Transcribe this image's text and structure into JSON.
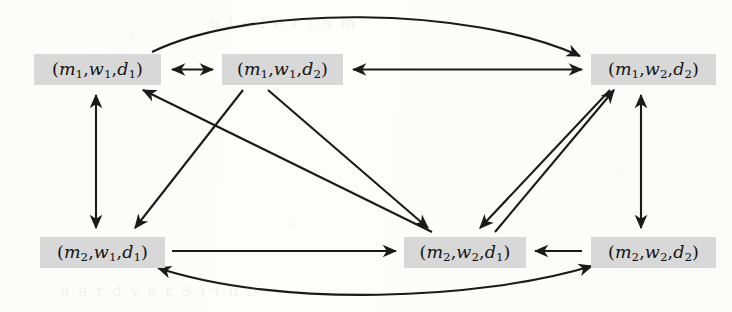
{
  "diagram": {
    "type": "directed-graph",
    "title": "",
    "background_color": "#fdfdfc",
    "node_fill_color": "#d8d8d8",
    "edge_color": "#1a1a1a",
    "nodes": [
      {
        "id": "m1w1d1",
        "label": "(m1,w1,d1)",
        "m": "1",
        "w": "1",
        "d": "1",
        "x": 34,
        "y": 54,
        "width": 127,
        "height": 31,
        "row": "top",
        "col": "left"
      },
      {
        "id": "m1w1d2",
        "label": "(m1,w1,d2)",
        "m": "1",
        "w": "1",
        "d": "2",
        "x": 222,
        "y": 54,
        "width": 121,
        "height": 31,
        "row": "top",
        "col": "middle"
      },
      {
        "id": "m1w2d2",
        "label": "(m1,w2,d2)",
        "m": "1",
        "w": "2",
        "d": "2",
        "x": 591,
        "y": 54,
        "width": 125,
        "height": 31,
        "row": "top",
        "col": "right"
      },
      {
        "id": "m2w1d1",
        "label": "(m2,w1,d1)",
        "m": "2",
        "w": "1",
        "d": "1",
        "x": 40,
        "y": 237,
        "width": 125,
        "height": 31,
        "row": "bottom",
        "col": "left"
      },
      {
        "id": "m2w2d1",
        "label": "(m2,w2,d1)",
        "m": "2",
        "w": "2",
        "d": "1",
        "x": 404,
        "y": 237,
        "width": 122,
        "height": 31,
        "row": "bottom",
        "col": "middle"
      },
      {
        "id": "m2w2d2",
        "label": "(m2,w2,d2)",
        "m": "2",
        "w": "2",
        "d": "2",
        "x": 591,
        "y": 237,
        "width": 125,
        "height": 31,
        "row": "bottom",
        "col": "right"
      }
    ],
    "edges": [
      {
        "from": "m1w1d1",
        "to": "m1w1d2",
        "direction": "both",
        "shape": "straight",
        "name": "edge-m1w1d1-m1w1d2"
      },
      {
        "from": "m1w1d2",
        "to": "m1w2d2",
        "direction": "both",
        "shape": "straight",
        "name": "edge-m1w1d2-m1w2d2"
      },
      {
        "from": "m1w1d1",
        "to": "m1w2d2",
        "direction": "forward",
        "shape": "curve-up",
        "name": "edge-m1w1d1-m1w2d2-arc"
      },
      {
        "from": "m1w1d1",
        "to": "m2w1d1",
        "direction": "both",
        "shape": "straight",
        "name": "edge-m1w1d1-m2w1d1"
      },
      {
        "from": "m1w2d2",
        "to": "m2w2d2",
        "direction": "both",
        "shape": "straight",
        "name": "edge-m1w2d2-m2w2d2"
      },
      {
        "from": "m1w1d2",
        "to": "m2w1d1",
        "direction": "forward",
        "shape": "straight",
        "name": "edge-m1w1d2-m2w1d1"
      },
      {
        "from": "m1w1d2",
        "to": "m2w2d1",
        "direction": "forward",
        "shape": "straight",
        "name": "edge-m1w1d2-m2w2d1"
      },
      {
        "from": "m1w2d2",
        "to": "m2w2d1",
        "direction": "forward",
        "shape": "straight",
        "name": "edge-m1w2d2-m2w2d1"
      },
      {
        "from": "m2w2d1",
        "to": "m1w1d1",
        "direction": "forward",
        "shape": "straight",
        "name": "edge-m2w2d1-m1w1d1"
      },
      {
        "from": "m2w2d1",
        "to": "m1w2d2",
        "direction": "forward",
        "shape": "straight",
        "name": "edge-m2w2d1-m1w2d2"
      },
      {
        "from": "m2w1d1",
        "to": "m2w2d1",
        "direction": "forward",
        "shape": "straight",
        "name": "edge-m2w1d1-m2w2d1"
      },
      {
        "from": "m2w2d2",
        "to": "m2w2d1",
        "direction": "forward",
        "shape": "straight",
        "name": "edge-m2w2d2-m2w2d1"
      },
      {
        "from": "m2w1d1",
        "to": "m2w2d2",
        "direction": "both",
        "shape": "curve-down",
        "name": "edge-m2w1d1-m2w2d2-arc"
      }
    ]
  }
}
